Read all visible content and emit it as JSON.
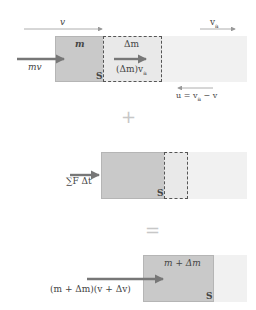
{
  "colors": {
    "system_box": "#c9c9c9",
    "added_mass_box": "#e9e9e9",
    "surrounding_fluid": "#f1f1f1",
    "thick_arrow": "#777777",
    "thin_arrow": "#999999",
    "operator": "#c7c7c7"
  },
  "top": {
    "v_label": "v",
    "va_label": "v",
    "va_sub": "a",
    "m_label": "m",
    "dm_label": "Δm",
    "mv_label": "mv",
    "dm_va_prefix": "(Δm)v",
    "dm_va_sub": "a",
    "s_label": "S",
    "u_label_prefix": "u = v",
    "u_label_sub": "a",
    "u_label_suffix": " − v"
  },
  "plus_sign": "+",
  "middle": {
    "impulse_label": "∑F Δt",
    "s_label": "S"
  },
  "equals_sign": "=",
  "bottom": {
    "m_dm_label": "m + Δm",
    "momentum_label": "(m + Δm)(v + Δv)",
    "s_label": "S"
  }
}
